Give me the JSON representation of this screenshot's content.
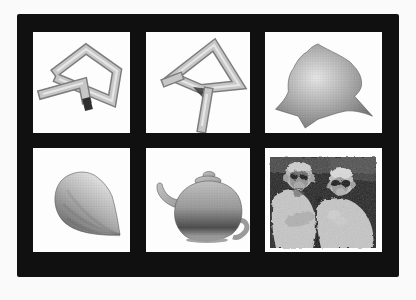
{
  "figure": {
    "kind": "scanned-figure-montage",
    "rows": 2,
    "cols": 3
  },
  "panels": [
    {
      "id": "tube-view-1",
      "label": "swept-tube-polyline-solid-view-1",
      "row": 1,
      "col": 1
    },
    {
      "id": "tube-view-2",
      "label": "swept-tube-polyline-solid-view-2",
      "row": 1,
      "col": 2
    },
    {
      "id": "spiky-blob",
      "label": "spiky-blob-surface",
      "row": 1,
      "col": 3
    },
    {
      "id": "cone",
      "label": "shaded-cone-teardrop",
      "row": 2,
      "col": 1
    },
    {
      "id": "teapot",
      "label": "utah-teapot",
      "row": 2,
      "col": 2
    },
    {
      "id": "monkeys",
      "label": "two-monkeys-photograph",
      "row": 2,
      "col": 3
    }
  ],
  "colors": {
    "page_bg": "#fafafa",
    "frame": "#101010",
    "panel_bg": "#fdfdfd",
    "tube_face": "#c6c6c6",
    "tube_edge": "#7d7d7d",
    "tube_highlight": "#ebebeb",
    "tube_cap": "#2e2e2e",
    "shade_light": "#e6e6e6",
    "shade_mid": "#b2b2b2",
    "shade_dark": "#6f6f6f",
    "teapot_light": "#c2c2c2",
    "teapot_mid": "#9a9a9a",
    "teapot_dark": "#4e4e4e",
    "photo_bg": "#232323",
    "fur_light": "#c6c6c6",
    "fur_mid": "#9e9e9e",
    "face_dark": "#161616"
  }
}
